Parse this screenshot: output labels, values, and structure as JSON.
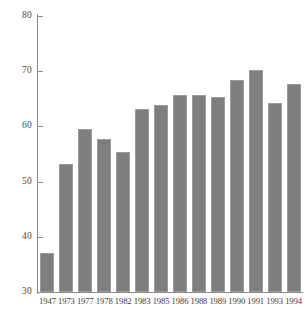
{
  "chart_data": {
    "type": "bar",
    "title": "",
    "subtitle": "",
    "xlabel": "",
    "ylabel": "",
    "categories": [
      "1947",
      "1973",
      "1977",
      "1978",
      "1982",
      "1983",
      "1985",
      "1986",
      "1988",
      "1989",
      "1990",
      "1991",
      "1993",
      "1994"
    ],
    "values": [
      37.1,
      53.1,
      59.5,
      57.8,
      55.4,
      63.1,
      63.8,
      65.6,
      65.6,
      65.4,
      68.4,
      70.3,
      64.3,
      67.6
    ],
    "ylim": [
      30,
      80
    ],
    "yticks": [
      30,
      40,
      50,
      60,
      70,
      80
    ],
    "ytick_labels": [
      "30",
      "40",
      "50",
      "60",
      "70",
      "80"
    ],
    "grid": false,
    "legend": null,
    "legend_position": "none",
    "bar_color": "#7e7e7e",
    "bar_edge_color": "#9c9c9c",
    "axis_color": "#8a8a8a",
    "background_color": "#ffffff",
    "annotations": []
  }
}
